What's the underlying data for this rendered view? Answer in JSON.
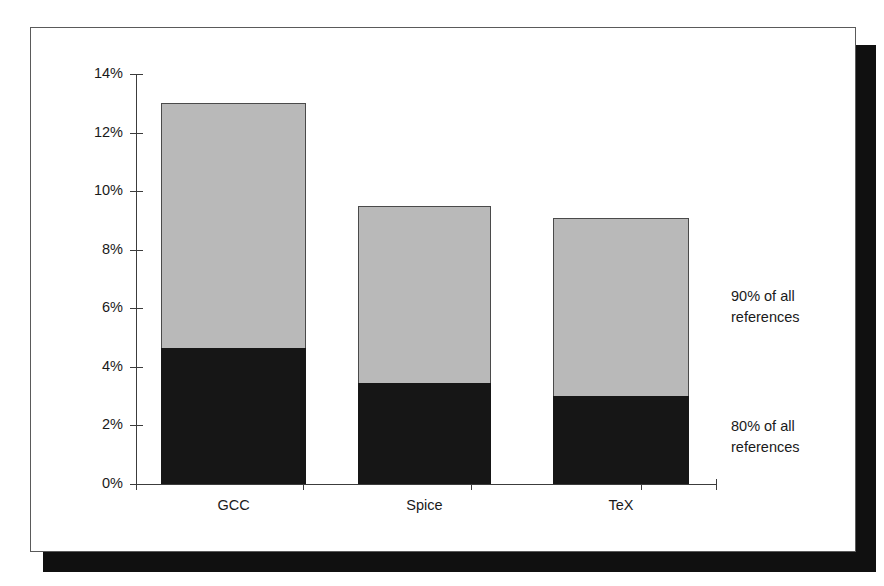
{
  "chart_data": {
    "type": "bar",
    "subtype": "stacked",
    "title": "",
    "xlabel": "",
    "ylabel": "",
    "categories": [
      "GCC",
      "Spice",
      "TeX"
    ],
    "series": [
      {
        "name": "80% of all references",
        "color": "#161616",
        "values": [
          4.65,
          3.45,
          3.0
        ]
      },
      {
        "name": "90% of all references",
        "color": "#b9b9b9",
        "values": [
          8.35,
          6.05,
          6.1
        ]
      }
    ],
    "totals": [
      13.0,
      9.5,
      9.1
    ],
    "ylim": [
      0,
      14
    ],
    "ytick_values": [
      0,
      2,
      4,
      6,
      8,
      10,
      12,
      14
    ],
    "ytick_labels": [
      "0%",
      "2%",
      "4%",
      "6%",
      "8%",
      "10%",
      "12%",
      "14%"
    ],
    "grid": false,
    "legend": "none",
    "annotations": [
      {
        "name": "upper-segment-label",
        "text": "90% of all\nreferences"
      },
      {
        "name": "lower-segment-label",
        "text": "80% of all\nreferences"
      }
    ]
  },
  "axis": {
    "y_ticks": [
      {
        "label": "14%",
        "value": 14
      },
      {
        "label": "12%",
        "value": 12
      },
      {
        "label": "10%",
        "value": 10
      },
      {
        "label": "8%",
        "value": 8
      },
      {
        "label": "6%",
        "value": 6
      },
      {
        "label": "4%",
        "value": 4
      },
      {
        "label": "2%",
        "value": 2
      },
      {
        "label": "0%",
        "value": 0
      }
    ],
    "x_categories": [
      {
        "label": "GCC"
      },
      {
        "label": "Spice"
      },
      {
        "label": "TeX"
      }
    ]
  },
  "colors": {
    "upper_segment": "#b9b9b9",
    "lower_segment": "#161616",
    "axis": "#3c3c3c",
    "text": "#1a1a1a",
    "panel_border": "#5a5a5a",
    "shadow": "#101010",
    "background": "#ffffff"
  }
}
